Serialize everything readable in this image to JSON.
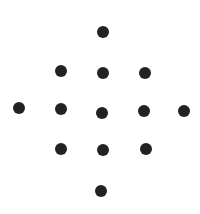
{
  "diagram": {
    "type": "dot-pattern",
    "shape": "diamond",
    "background": "#ffffff",
    "dot_color": "#222222",
    "dot_diameter": 12,
    "dot_count": 13,
    "dots": [
      {
        "x": 103,
        "y": 32
      },
      {
        "x": 61,
        "y": 71
      },
      {
        "x": 103,
        "y": 73
      },
      {
        "x": 145,
        "y": 73
      },
      {
        "x": 19,
        "y": 108
      },
      {
        "x": 61,
        "y": 109
      },
      {
        "x": 102,
        "y": 113
      },
      {
        "x": 144,
        "y": 111
      },
      {
        "x": 184,
        "y": 111
      },
      {
        "x": 61,
        "y": 149
      },
      {
        "x": 103,
        "y": 150
      },
      {
        "x": 146,
        "y": 149
      },
      {
        "x": 101,
        "y": 191
      }
    ]
  }
}
